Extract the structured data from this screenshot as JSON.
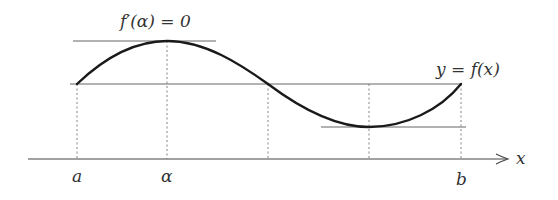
{
  "diagram": {
    "curve_label": "y = f(x)",
    "tangent_label": "f′(α) = 0",
    "axis_label": "x",
    "point_labels": {
      "a": "a",
      "alpha": "α",
      "b": "b"
    },
    "colors": {
      "curve": "#1a1a1a",
      "lines": "#555555",
      "dashed": "#777777",
      "text": "#333333"
    },
    "geometry": {
      "axis_y": 159,
      "axis_x_start": 28,
      "axis_x_end": 508,
      "x_a": 77,
      "x_alpha": 167,
      "x_mid": 268,
      "x_min": 369,
      "x_b": 461,
      "y_base": 84,
      "y_max": 41,
      "y_min": 127
    }
  }
}
